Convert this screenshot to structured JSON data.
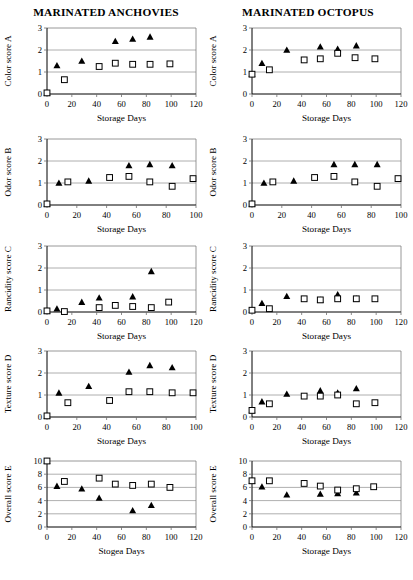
{
  "figure": {
    "columns": [
      {
        "id": "anchovies",
        "title": "MARINATED ANCHOVIES"
      },
      {
        "id": "octopus",
        "title": "MARINATED OCTOPUS"
      }
    ]
  },
  "chart_data": [
    {
      "id": "anchovies-color",
      "type": "scatter",
      "title": "MARINATED ANCHOVIES",
      "xlabel": "Storage Days",
      "ylabel": "Color score A",
      "xlim": [
        0,
        120
      ],
      "ylim": [
        0,
        3
      ],
      "xticks": [
        0,
        20,
        40,
        60,
        80,
        100,
        120
      ],
      "yticks": [
        0,
        1,
        2,
        3
      ],
      "gridlines": [
        1,
        2
      ],
      "grid": true,
      "legend": "none",
      "series": [
        {
          "name": "filled-triangle",
          "marker": "triangle",
          "x": [
            0,
            8,
            28,
            55,
            69,
            83
          ],
          "y": [
            0.05,
            1.3,
            1.5,
            2.4,
            2.5,
            2.6
          ]
        },
        {
          "name": "open-square",
          "marker": "square",
          "x": [
            0,
            14,
            42,
            55,
            69,
            83,
            99
          ],
          "y": [
            0.05,
            0.65,
            1.25,
            1.4,
            1.35,
            1.35,
            1.37
          ]
        }
      ]
    },
    {
      "id": "octopus-color",
      "type": "scatter",
      "title": "MARINATED OCTOPUS",
      "xlabel": "Storage Days",
      "ylabel": "Color score A",
      "xlim": [
        0,
        120
      ],
      "ylim": [
        0,
        3
      ],
      "xticks": [
        0,
        20,
        40,
        60,
        80,
        100,
        120
      ],
      "yticks": [
        0,
        1,
        2,
        3
      ],
      "gridlines": [
        1,
        2
      ],
      "grid": true,
      "legend": "none",
      "series": [
        {
          "name": "filled-triangle",
          "marker": "triangle",
          "x": [
            0,
            8,
            28,
            55,
            69,
            84
          ],
          "y": [
            0.9,
            1.4,
            2.0,
            2.15,
            2.05,
            2.2
          ]
        },
        {
          "name": "open-square",
          "marker": "square",
          "x": [
            0,
            14,
            42,
            55,
            69,
            83,
            99
          ],
          "y": [
            0.9,
            1.1,
            1.55,
            1.6,
            1.85,
            1.65,
            1.6
          ]
        }
      ]
    },
    {
      "id": "anchovies-odor",
      "type": "scatter",
      "title": "",
      "xlabel": "Storage Days",
      "ylabel": "Odor score B",
      "xlim": [
        0,
        100
      ],
      "ylim": [
        0,
        3
      ],
      "xticks": [
        0,
        20,
        40,
        60,
        80,
        100
      ],
      "yticks": [
        0,
        1,
        2,
        3
      ],
      "gridlines": [
        1,
        2
      ],
      "grid": true,
      "legend": "none",
      "series": [
        {
          "name": "filled-triangle",
          "marker": "triangle",
          "x": [
            0,
            8,
            28,
            55,
            69,
            84
          ],
          "y": [
            0.05,
            1.0,
            1.1,
            1.8,
            1.85,
            1.8
          ]
        },
        {
          "name": "open-square",
          "marker": "square",
          "x": [
            0,
            14,
            42,
            55,
            69,
            84,
            98
          ],
          "y": [
            0.05,
            1.05,
            1.25,
            1.3,
            1.05,
            0.85,
            1.2
          ]
        }
      ]
    },
    {
      "id": "octopus-odor",
      "type": "scatter",
      "title": "",
      "xlabel": "Storage Days",
      "ylabel": "Odor score B",
      "xlim": [
        0,
        100
      ],
      "ylim": [
        0,
        3
      ],
      "xticks": [
        0,
        20,
        40,
        60,
        80,
        100
      ],
      "yticks": [
        0,
        1,
        2,
        3
      ],
      "gridlines": [
        1,
        2
      ],
      "grid": true,
      "legend": "none",
      "series": [
        {
          "name": "filled-triangle",
          "marker": "triangle",
          "x": [
            0,
            8,
            28,
            55,
            69,
            84
          ],
          "y": [
            0.05,
            1.0,
            1.1,
            1.85,
            1.85,
            1.85
          ]
        },
        {
          "name": "open-square",
          "marker": "square",
          "x": [
            0,
            14,
            42,
            55,
            69,
            84,
            98
          ],
          "y": [
            0.05,
            1.05,
            1.25,
            1.3,
            1.05,
            0.85,
            1.2
          ]
        }
      ]
    },
    {
      "id": "anchovies-rancidity",
      "type": "scatter",
      "title": "",
      "xlabel": "Storage Days",
      "ylabel": "Rancidity score C",
      "xlim": [
        0,
        120
      ],
      "ylim": [
        0,
        3
      ],
      "xticks": [
        0,
        20,
        40,
        60,
        80,
        100,
        120
      ],
      "yticks": [
        0,
        1,
        2,
        3
      ],
      "gridlines": [
        1,
        2
      ],
      "grid": true,
      "legend": "none",
      "series": [
        {
          "name": "filled-triangle",
          "marker": "triangle",
          "x": [
            0,
            8,
            28,
            42,
            69,
            84
          ],
          "y": [
            0.05,
            0.15,
            0.45,
            0.65,
            0.7,
            1.85
          ]
        },
        {
          "name": "open-square",
          "marker": "square",
          "x": [
            0,
            14,
            42,
            55,
            69,
            84,
            98
          ],
          "y": [
            0.05,
            0.02,
            0.2,
            0.3,
            0.25,
            0.2,
            0.45
          ]
        }
      ]
    },
    {
      "id": "octopus-rancidity",
      "type": "scatter",
      "title": "",
      "xlabel": "Storage Days",
      "ylabel": "Rancidity score C",
      "xlim": [
        0,
        120
      ],
      "ylim": [
        0,
        3
      ],
      "xticks": [
        0,
        20,
        40,
        60,
        80,
        100,
        120
      ],
      "yticks": [
        0,
        1,
        2,
        3
      ],
      "gridlines": [
        1,
        2
      ],
      "grid": true,
      "legend": "none",
      "series": [
        {
          "name": "filled-triangle",
          "marker": "triangle",
          "x": [
            0,
            8,
            28,
            55,
            69,
            84
          ],
          "y": [
            0.08,
            0.4,
            0.72,
            0.55,
            0.8,
            0.6
          ]
        },
        {
          "name": "open-square",
          "marker": "square",
          "x": [
            0,
            14,
            42,
            55,
            69,
            84,
            99
          ],
          "y": [
            0.08,
            0.15,
            0.6,
            0.55,
            0.6,
            0.6,
            0.6
          ]
        }
      ]
    },
    {
      "id": "anchovies-texture",
      "type": "scatter",
      "title": "",
      "xlabel": "Storage Days",
      "ylabel": "Texture score D",
      "xlim": [
        0,
        100
      ],
      "ylim": [
        0,
        3
      ],
      "xticks": [
        0,
        20,
        40,
        60,
        80,
        100
      ],
      "yticks": [
        0,
        1,
        2,
        3
      ],
      "gridlines": [
        1,
        2
      ],
      "grid": true,
      "legend": "none",
      "series": [
        {
          "name": "filled-triangle",
          "marker": "triangle",
          "x": [
            0,
            8,
            28,
            55,
            69,
            84
          ],
          "y": [
            0.05,
            1.1,
            1.4,
            2.05,
            2.35,
            2.25
          ]
        },
        {
          "name": "open-square",
          "marker": "square",
          "x": [
            0,
            14,
            42,
            55,
            69,
            84,
            98
          ],
          "y": [
            0.05,
            0.65,
            0.75,
            1.15,
            1.15,
            1.1,
            1.1
          ]
        }
      ]
    },
    {
      "id": "octopus-texture",
      "type": "scatter",
      "title": "",
      "xlabel": "Storage Days",
      "ylabel": "Texture score D",
      "xlim": [
        0,
        120
      ],
      "ylim": [
        0,
        3
      ],
      "xticks": [
        0,
        20,
        40,
        60,
        80,
        100,
        120
      ],
      "yticks": [
        0,
        1,
        2,
        3
      ],
      "gridlines": [
        1,
        2
      ],
      "grid": true,
      "legend": "none",
      "series": [
        {
          "name": "filled-triangle",
          "marker": "triangle",
          "x": [
            0,
            8,
            28,
            55,
            69,
            84
          ],
          "y": [
            0.3,
            0.7,
            1.05,
            1.2,
            1.1,
            1.3
          ]
        },
        {
          "name": "open-square",
          "marker": "square",
          "x": [
            0,
            14,
            42,
            55,
            69,
            84,
            99
          ],
          "y": [
            0.3,
            0.6,
            0.95,
            0.95,
            1.0,
            0.6,
            0.65
          ]
        }
      ]
    },
    {
      "id": "anchovies-overall",
      "type": "scatter",
      "title": "",
      "xlabel": "Stogea Days",
      "ylabel": "Overall score E",
      "xlim": [
        0,
        120
      ],
      "ylim": [
        0,
        10
      ],
      "xticks": [
        0,
        20,
        40,
        60,
        80,
        100,
        120
      ],
      "yticks": [
        0,
        2,
        4,
        6,
        8,
        10
      ],
      "gridlines": [
        2,
        4,
        6,
        8
      ],
      "grid": true,
      "legend": "none",
      "series": [
        {
          "name": "filled-triangle",
          "marker": "triangle",
          "x": [
            0,
            8,
            28,
            42,
            69,
            84
          ],
          "y": [
            10.0,
            6.2,
            5.8,
            4.4,
            2.5,
            3.3
          ]
        },
        {
          "name": "open-square",
          "marker": "square",
          "x": [
            0,
            14,
            42,
            55,
            69,
            84,
            99
          ],
          "y": [
            10.0,
            6.9,
            7.4,
            6.5,
            6.3,
            6.5,
            6.0
          ]
        }
      ]
    },
    {
      "id": "octopus-overall",
      "type": "scatter",
      "title": "",
      "xlabel": "Storage Days",
      "ylabel": "Overall score E",
      "xlim": [
        0,
        120
      ],
      "ylim": [
        0,
        10
      ],
      "xticks": [
        0,
        20,
        40,
        60,
        80,
        100,
        120
      ],
      "yticks": [
        0,
        2,
        4,
        6,
        8,
        10
      ],
      "gridlines": [
        2,
        4,
        6,
        8
      ],
      "grid": true,
      "legend": "none",
      "series": [
        {
          "name": "filled-triangle",
          "marker": "triangle",
          "x": [
            0,
            8,
            28,
            55,
            69,
            84
          ],
          "y": [
            7.0,
            6.1,
            4.9,
            5.0,
            5.1,
            5.2
          ]
        },
        {
          "name": "open-square",
          "marker": "square",
          "x": [
            0,
            14,
            42,
            55,
            69,
            84,
            98
          ],
          "y": [
            7.0,
            7.0,
            6.6,
            6.2,
            5.6,
            5.8,
            6.1
          ]
        }
      ]
    }
  ]
}
